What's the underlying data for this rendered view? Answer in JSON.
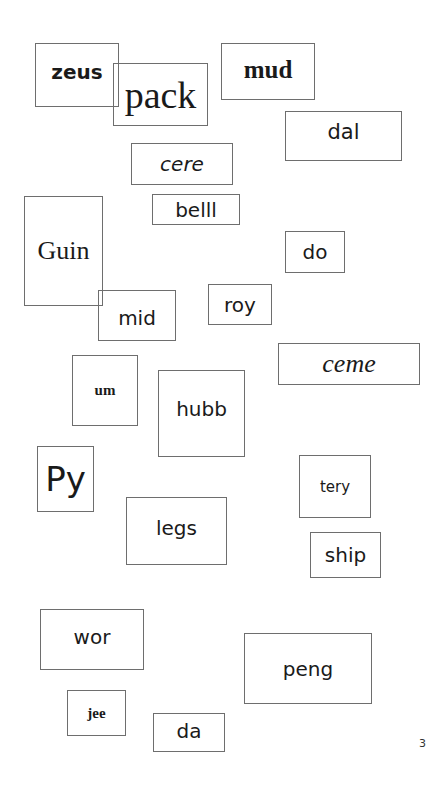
{
  "page": {
    "page_number": "3",
    "words": [
      {
        "id": "zeus",
        "text": "zeus"
      },
      {
        "id": "pack",
        "text": "pack"
      },
      {
        "id": "mud",
        "text": "mud"
      },
      {
        "id": "dal",
        "text": "dal"
      },
      {
        "id": "cere",
        "text": "cere"
      },
      {
        "id": "belll",
        "text": "belll"
      },
      {
        "id": "guin",
        "text": "Guin"
      },
      {
        "id": "do",
        "text": "do"
      },
      {
        "id": "mid",
        "text": "mid"
      },
      {
        "id": "roy",
        "text": "roy"
      },
      {
        "id": "ceme",
        "text": "ceme"
      },
      {
        "id": "um",
        "text": "um"
      },
      {
        "id": "hubb",
        "text": "hubb"
      },
      {
        "id": "py",
        "text": "Py"
      },
      {
        "id": "tery",
        "text": "tery"
      },
      {
        "id": "legs",
        "text": "legs"
      },
      {
        "id": "ship",
        "text": "ship"
      },
      {
        "id": "wor",
        "text": "wor"
      },
      {
        "id": "peng",
        "text": "peng"
      },
      {
        "id": "jee",
        "text": "jee"
      },
      {
        "id": "da",
        "text": "da"
      }
    ]
  }
}
